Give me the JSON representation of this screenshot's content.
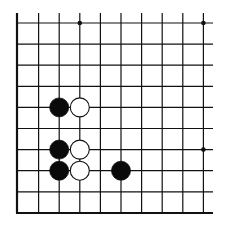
{
  "board": {
    "description": "Go board fragment (lower-left corner region)",
    "columns": 10,
    "rows": 10,
    "origin_x": 18,
    "origin_y": 23,
    "spacing_x": 20.6,
    "spacing_y": 21.1,
    "line_top": 13,
    "line_right": 213,
    "left_edge_x": 17,
    "bottom_edge_y": 213,
    "line_color": "#111111",
    "background": "#ffffff",
    "star_points": [
      {
        "col": 3,
        "row": 0
      },
      {
        "col": 9,
        "row": 0
      },
      {
        "col": 9,
        "row": 6
      }
    ],
    "stones": [
      {
        "color": "black",
        "col": 2,
        "row": 4
      },
      {
        "color": "white",
        "col": 3,
        "row": 4
      },
      {
        "color": "black",
        "col": 2,
        "row": 6
      },
      {
        "color": "white",
        "col": 3,
        "row": 6
      },
      {
        "color": "black",
        "col": 2,
        "row": 7
      },
      {
        "color": "white",
        "col": 3,
        "row": 7
      },
      {
        "color": "black",
        "col": 5,
        "row": 7
      }
    ],
    "stone_radius": 9.5
  }
}
